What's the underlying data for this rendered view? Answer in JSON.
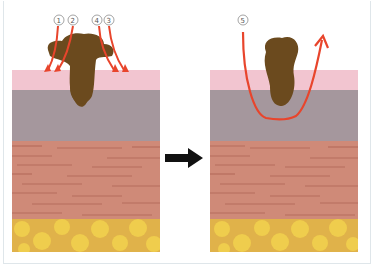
{
  "diagram": {
    "type": "skin-treatment-comparison",
    "layers": [
      "epidermis",
      "basal-layer",
      "dermis",
      "subcutaneous-fat"
    ],
    "colors": {
      "epidermis": "#f2c5d0",
      "basal": "#a5979d",
      "dermis": "#cf8a78",
      "dermis_lines": "#b06656",
      "fat": "#e0b24a",
      "fat_cells": "#f2d24e",
      "lesion": "#6b4a1e",
      "arrow_red": "#e8452c",
      "transition_arrow": "#111111"
    },
    "left_panel": {
      "labels": [
        "①",
        "②",
        "④",
        "③"
      ],
      "arrow_count": 4
    },
    "right_panel": {
      "labels": [
        "⑤"
      ],
      "arrow_count": 1
    },
    "transition": "right-arrow"
  }
}
